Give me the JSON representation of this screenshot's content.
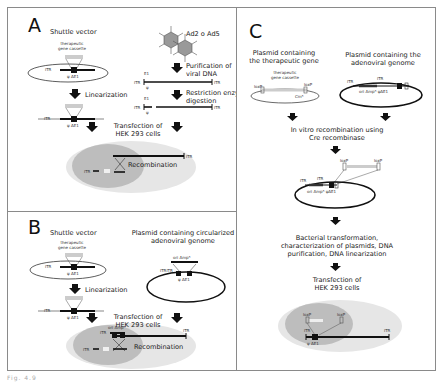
{
  "panels": {
    "A": {
      "letter": "A",
      "shuttle_vector": "Shuttle vector",
      "cassette_line1": "therapeutic",
      "cassette_line2": "gene cassette",
      "itr": "ITR",
      "psi_de1": "ψ ΔE1",
      "linearization": "Linearization",
      "virus_label": "Ad2 o Ad5",
      "purification_line1": "Purification of",
      "purification_line2": "viral DNA",
      "e1": "E1",
      "psi": "ψ",
      "restriction_line1": "Restriction enzyme",
      "restriction_line2": "digestion",
      "transfection_line1": "Transfection of",
      "transfection_line2": "HEK 293 cells",
      "recombination": "Recombination"
    },
    "B": {
      "letter": "B",
      "shuttle_vector": "Shuttle vector",
      "cassette_line1": "therapeutic",
      "cassette_line2": "gene cassette",
      "itr": "ITR",
      "psi_de1": "ψ ΔE1",
      "linearization": "Linearization",
      "plasmid_line1": "Plasmid containing circularized",
      "plasmid_line2": "adenoviral genome",
      "ori_amp": "ori Ampᴿ",
      "itr_itr": "ITRITR",
      "psi_de1_plasmid": "ψ ΔE1",
      "transfection_line1": "Transfection of",
      "transfection_line2": "HEK 293 cells",
      "recombination": "Recombination"
    },
    "C": {
      "letter": "C",
      "plasmid_gene_line1": "Plasmid containing",
      "plasmid_gene_line2": "the therapeutic gene",
      "plasmid_adeno_line1": "Plasmid containing the",
      "plasmid_adeno_line2": "adenoviral genome",
      "cassette_line1": "therapeutic",
      "cassette_line2": "gene cassette",
      "loxp": "loxP",
      "cmr": "Cmᴿ",
      "itr": "ITR",
      "ori_amp_psi": "ori Ampᴿ ψΔE1",
      "invitro_line1": "In vitro recombination using",
      "invitro_line2": "Cre recombinase",
      "bacterial_line1": "Bacterial transformation,",
      "bacterial_line2": "characterization of plasmids, DNA",
      "bacterial_line3": "purification, DNA linearization",
      "transfection_line1": "Transfection of",
      "transfection_line2": "HEK 293 cells",
      "psi_de1": "ψ ΔE1"
    }
  },
  "caption": "Fig. 4.9"
}
